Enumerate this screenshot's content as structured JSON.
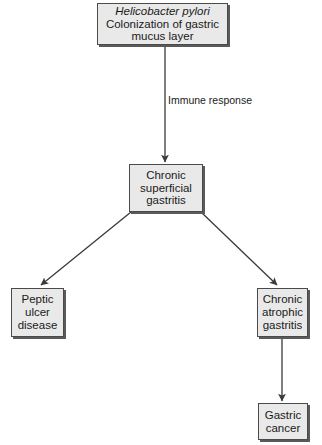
{
  "diagram": {
    "background_color": "#ffffff",
    "node_fill_color": "#e9e9e9",
    "node_border_color": "#4a4a4a",
    "text_color": "#1a1a1a",
    "nodes": [
      {
        "id": "hpylori",
        "line1_italic": "Helicobacter pylori",
        "line2": "Colonization of gastric",
        "line3": "mucus layer"
      },
      {
        "id": "chronic-superficial",
        "line1": "Chronic",
        "line2": "superficial",
        "line3": "gastritis"
      },
      {
        "id": "peptic-ulcer",
        "line1": "Peptic",
        "line2": "ulcer",
        "line3": "disease"
      },
      {
        "id": "chronic-atrophic",
        "line1": "Chronic",
        "line2": "atrophic",
        "line3": "gastritis"
      },
      {
        "id": "gastric-cancer",
        "line1": "Gastric",
        "line2": "cancer"
      }
    ],
    "edge_labels": {
      "immune_line1": "Immune",
      "immune_line2": "response"
    }
  }
}
